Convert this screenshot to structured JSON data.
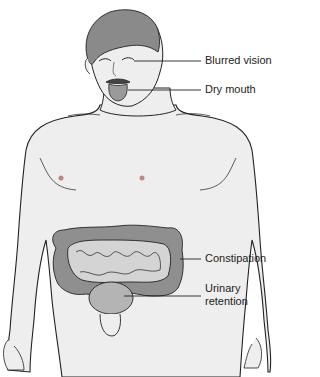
{
  "figure": {
    "labels": [
      {
        "text": "Blurred vision"
      },
      {
        "text": "Dry mouth"
      },
      {
        "text": "Constipation"
      },
      {
        "text": "Urinary"
      },
      {
        "text": "retention"
      }
    ]
  },
  "colors": {
    "skin": "#eeeeee",
    "outline": "#222222",
    "hair": "#8a8a8a",
    "colon": "#8f8f8f",
    "small_intestine": "#d4d4d4",
    "bladder": "#b4b4b4",
    "tongue": "#9a9a9a"
  }
}
